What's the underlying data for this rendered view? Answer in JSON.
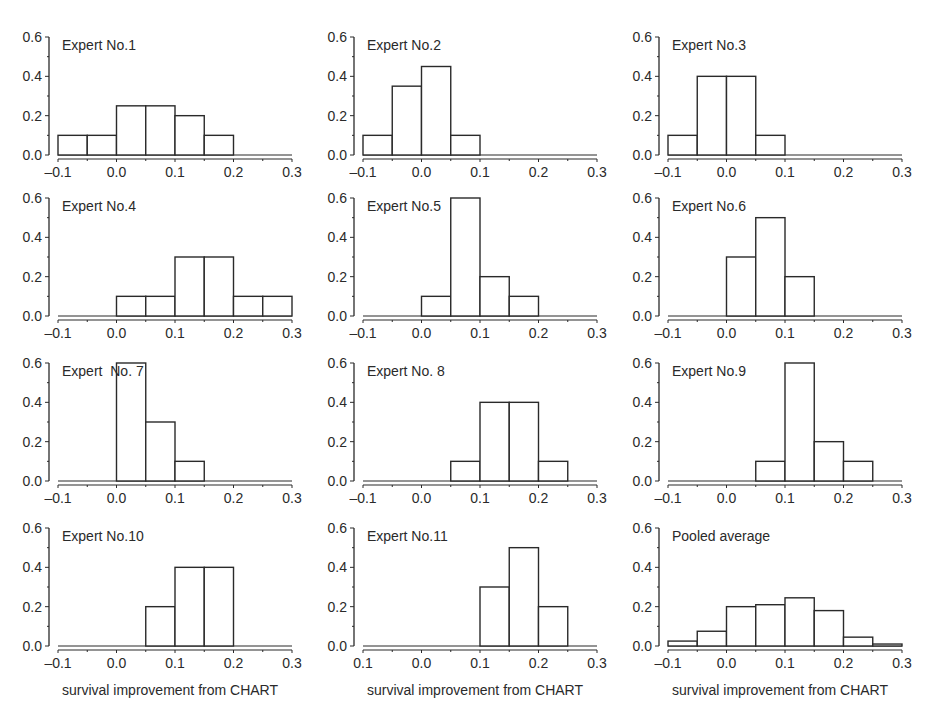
{
  "figure": {
    "xlabel": "survival improvement from CHART"
  },
  "chart_data": [
    {
      "type": "bar",
      "title": "Expert No.1",
      "bin_edges": [
        -0.1,
        -0.05,
        0.0,
        0.05,
        0.1,
        0.15,
        0.2,
        0.25,
        0.3
      ],
      "values": [
        0.1,
        0.1,
        0.25,
        0.25,
        0.2,
        0.1,
        0,
        0
      ],
      "xlabel": "",
      "ylabel": "",
      "xlim": [
        -0.1,
        0.3
      ],
      "ylim": [
        0,
        0.6
      ],
      "xticks": [
        "-0.1",
        "0.0",
        "0.1",
        "0.2",
        "0.3"
      ],
      "yticks": [
        "0.0",
        "0.2",
        "0.4",
        "0.6"
      ]
    },
    {
      "type": "bar",
      "title": "Expert No.2",
      "bin_edges": [
        -0.1,
        -0.05,
        0.0,
        0.05,
        0.1,
        0.15,
        0.2,
        0.25,
        0.3
      ],
      "values": [
        0.1,
        0.35,
        0.45,
        0.1,
        0,
        0,
        0,
        0
      ],
      "xlabel": "",
      "ylabel": "",
      "xlim": [
        -0.1,
        0.3
      ],
      "ylim": [
        0,
        0.6
      ],
      "xticks": [
        "-0.1",
        "0.0",
        "0.1",
        "0.2",
        "0.3"
      ],
      "yticks": [
        "0.0",
        "0.2",
        "0.4",
        "0.6"
      ]
    },
    {
      "type": "bar",
      "title": "Expert No.3",
      "bin_edges": [
        -0.1,
        -0.05,
        0.0,
        0.05,
        0.1,
        0.15,
        0.2,
        0.25,
        0.3
      ],
      "values": [
        0.1,
        0.4,
        0.4,
        0.1,
        0,
        0,
        0,
        0
      ],
      "xlabel": "",
      "ylabel": "",
      "xlim": [
        -0.1,
        0.3
      ],
      "ylim": [
        0,
        0.6
      ],
      "xticks": [
        "-0.1",
        "0.0",
        "0.1",
        "0.2",
        "0.3"
      ],
      "yticks": [
        "0.0",
        "0.2",
        "0.4",
        "0.6"
      ]
    },
    {
      "type": "bar",
      "title": "Expert No.4",
      "bin_edges": [
        -0.1,
        -0.05,
        0.0,
        0.05,
        0.1,
        0.15,
        0.2,
        0.25,
        0.3
      ],
      "values": [
        0,
        0,
        0.1,
        0.1,
        0.3,
        0.3,
        0.1,
        0.1
      ],
      "xlabel": "",
      "ylabel": "",
      "xlim": [
        -0.1,
        0.3
      ],
      "ylim": [
        0,
        0.6
      ],
      "xticks": [
        "-0.1",
        "0.0",
        "0.1",
        "0.2",
        "0.3"
      ],
      "yticks": [
        "0.0",
        "0.2",
        "0.4",
        "0.6"
      ]
    },
    {
      "type": "bar",
      "title": "Expert No.5",
      "bin_edges": [
        -0.1,
        -0.05,
        0.0,
        0.05,
        0.1,
        0.15,
        0.2,
        0.25,
        0.3
      ],
      "values": [
        0,
        0,
        0.1,
        0.6,
        0.2,
        0.1,
        0,
        0
      ],
      "xlabel": "",
      "ylabel": "",
      "xlim": [
        -0.1,
        0.3
      ],
      "ylim": [
        0,
        0.6
      ],
      "xticks": [
        "-0.1",
        "0.0",
        "0.1",
        "0.2",
        "0.3"
      ],
      "yticks": [
        "0.0",
        "0.2",
        "0.4",
        "0.6"
      ]
    },
    {
      "type": "bar",
      "title": "Expert No.6",
      "bin_edges": [
        -0.1,
        -0.05,
        0.0,
        0.05,
        0.1,
        0.15,
        0.2,
        0.25,
        0.3
      ],
      "values": [
        0,
        0,
        0.3,
        0.5,
        0.2,
        0,
        0,
        0
      ],
      "xlabel": "",
      "ylabel": "",
      "xlim": [
        -0.1,
        0.3
      ],
      "ylim": [
        0,
        0.6
      ],
      "xticks": [
        "-0.1",
        "0.0",
        "0.1",
        "0.2",
        "0.3"
      ],
      "yticks": [
        "0.0",
        "0.2",
        "0.4",
        "0.6"
      ]
    },
    {
      "type": "bar",
      "title": "Expert  No. 7",
      "bin_edges": [
        -0.1,
        -0.05,
        0.0,
        0.05,
        0.1,
        0.15,
        0.2,
        0.25,
        0.3
      ],
      "values": [
        0,
        0,
        0.6,
        0.3,
        0.1,
        0,
        0,
        0
      ],
      "xlabel": "",
      "ylabel": "",
      "xlim": [
        -0.1,
        0.3
      ],
      "ylim": [
        0,
        0.6
      ],
      "xticks": [
        "-0.1",
        "0.0",
        "0.1",
        "0.2",
        "0.3"
      ],
      "yticks": [
        "0.0",
        "0.2",
        "0.4",
        "0.6"
      ]
    },
    {
      "type": "bar",
      "title": "Expert No. 8",
      "bin_edges": [
        -0.1,
        -0.05,
        0.0,
        0.05,
        0.1,
        0.15,
        0.2,
        0.25,
        0.3
      ],
      "values": [
        0,
        0,
        0,
        0.1,
        0.4,
        0.4,
        0.1,
        0
      ],
      "xlabel": "",
      "ylabel": "",
      "xlim": [
        -0.1,
        0.3
      ],
      "ylim": [
        0,
        0.6
      ],
      "xticks": [
        "-0.1",
        "0.0",
        "0.1",
        "0.2",
        "0.3"
      ],
      "yticks": [
        "0.0",
        "0.2",
        "0.4",
        "0.6"
      ]
    },
    {
      "type": "bar",
      "title": "Expert No.9",
      "bin_edges": [
        -0.1,
        -0.05,
        0.0,
        0.05,
        0.1,
        0.15,
        0.2,
        0.25,
        0.3
      ],
      "values": [
        0,
        0,
        0,
        0.1,
        0.6,
        0.2,
        0.1,
        0
      ],
      "xlabel": "",
      "ylabel": "",
      "xlim": [
        -0.1,
        0.3
      ],
      "ylim": [
        0,
        0.6
      ],
      "xticks": [
        "-0.1",
        "0.0",
        "0.1",
        "0.2",
        "0.3"
      ],
      "yticks": [
        "0.0",
        "0.2",
        "0.4",
        "0.6"
      ]
    },
    {
      "type": "bar",
      "title": "Expert No.10",
      "bin_edges": [
        -0.1,
        -0.05,
        0.0,
        0.05,
        0.1,
        0.15,
        0.2,
        0.25,
        0.3
      ],
      "values": [
        0,
        0,
        0,
        0.2,
        0.4,
        0.4,
        0,
        0
      ],
      "xlabel": "survival improvement from CHART",
      "ylabel": "",
      "xlim": [
        -0.1,
        0.3
      ],
      "ylim": [
        0,
        0.6
      ],
      "xticks": [
        "-0.1",
        "0.0",
        "0.1",
        "0.2",
        "0.3"
      ],
      "yticks": [
        "0.0",
        "0.2",
        "0.4",
        "0.6"
      ]
    },
    {
      "type": "bar",
      "title": "Expert No.11",
      "bin_edges": [
        -0.1,
        -0.05,
        0.0,
        0.05,
        0.1,
        0.15,
        0.2,
        0.25,
        0.3
      ],
      "values": [
        0,
        0,
        0,
        0,
        0.3,
        0.5,
        0.2,
        0
      ],
      "xlabel": "survival improvement from CHART",
      "ylabel": "",
      "xlim": [
        -0.1,
        0.3
      ],
      "ylim": [
        0,
        0.6
      ],
      "xticks": [
        "0.1",
        "0.0",
        "0.1",
        "0.2",
        "0.3"
      ],
      "yticks": [
        "0.0",
        "0.2",
        "0.4",
        "0.6"
      ]
    },
    {
      "type": "bar",
      "title": "Pooled average",
      "bin_edges": [
        -0.1,
        -0.05,
        0.0,
        0.05,
        0.1,
        0.15,
        0.2,
        0.25,
        0.3
      ],
      "values": [
        0.025,
        0.075,
        0.2,
        0.21,
        0.245,
        0.18,
        0.045,
        0.01
      ],
      "xlabel": "survival improvement from CHART",
      "ylabel": "",
      "xlim": [
        -0.1,
        0.3
      ],
      "ylim": [
        0,
        0.6
      ],
      "xticks": [
        "-0.1",
        "0.0",
        "0.1",
        "0.2",
        "0.3"
      ],
      "yticks": [
        "0.0",
        "0.2",
        "0.4",
        "0.6"
      ]
    }
  ],
  "style": {
    "ink": "#2a2a2a",
    "bar_fill": "#ffffff",
    "background": "#ffffff"
  }
}
